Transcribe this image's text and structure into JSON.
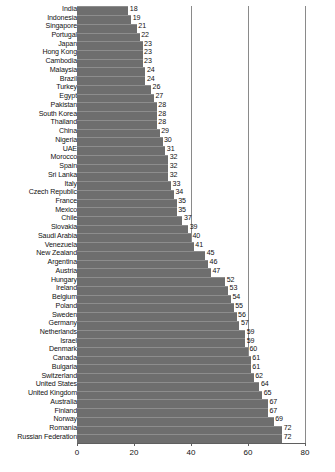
{
  "chart_data": {
    "type": "bar",
    "orientation": "horizontal",
    "title": "",
    "subtitle": "",
    "xlabel": "",
    "ylabel": "",
    "xlim": [
      0,
      80
    ],
    "xticks": [
      0,
      20,
      40,
      60,
      80
    ],
    "gridlines": [
      40,
      60,
      80
    ],
    "grid": true,
    "legend": null,
    "bar_color": "#6e6e6e",
    "show_value_labels": true,
    "categories": [
      "India",
      "Indonesia",
      "Singapore",
      "Portugal",
      "Japan",
      "Hong Kong",
      "Cambodia",
      "Malaysia",
      "Brazil",
      "Turkey",
      "Egypt",
      "Pakistan",
      "South Korea",
      "Thailand",
      "China",
      "Nigeria",
      "UAE",
      "Morocco",
      "Spain",
      "Sri Lanka",
      "Italy",
      "Czech Republic",
      "France",
      "Mexico",
      "Chile",
      "Slovakia",
      "Saudi Arabia",
      "Venezuela",
      "New Zealand",
      "Argentina",
      "Austria",
      "Hungary",
      "Ireland",
      "Belgium",
      "Poland",
      "Sweden",
      "Germany",
      "Netherlands",
      "Israel",
      "Denmark",
      "Canada",
      "Bulgaria",
      "Switzerland",
      "United States",
      "United Kingdom",
      "Australia",
      "Finland",
      "Norway",
      "Romania",
      "Russian Federation"
    ],
    "values": [
      18,
      19,
      21,
      22,
      23,
      23,
      23,
      24,
      24,
      26,
      27,
      28,
      28,
      28,
      29,
      30,
      31,
      32,
      32,
      32,
      33,
      34,
      35,
      35,
      37,
      39,
      40,
      41,
      45,
      46,
      47,
      52,
      53,
      54,
      55,
      56,
      57,
      59,
      59,
      60,
      61,
      61,
      62,
      64,
      65,
      67,
      67,
      69,
      72,
      72
    ]
  }
}
